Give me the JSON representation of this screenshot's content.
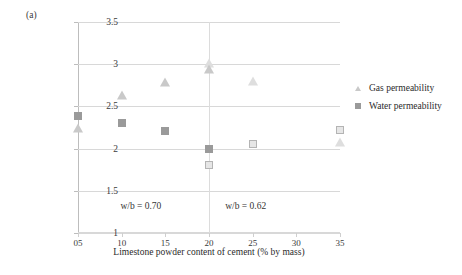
{
  "panel_label": "(a)",
  "chart_data": {
    "type": "scatter",
    "title": "",
    "xlabel": "Limestone powder content of cement (% by mass)",
    "ylabel_line1": "Gas permeability (×10⁻¹⁷ m²)",
    "ylabel_line2": "Water permeability (×10⁻¹⁷ m/s)",
    "xtick_labels": [
      "05",
      "10",
      "15",
      "20",
      "25",
      "30",
      "35"
    ],
    "xtick_values": [
      5,
      10,
      15,
      20,
      25,
      30,
      35
    ],
    "ytick_labels": [
      "1",
      "1.5",
      "2",
      "2.5",
      "3",
      "3.5"
    ],
    "ytick_values": [
      1,
      1.5,
      2,
      2.5,
      3,
      3.5
    ],
    "xlim": [
      5,
      35
    ],
    "ylim": [
      1,
      3.5
    ],
    "grid": "horizontal",
    "legend_position": "right",
    "series": [
      {
        "name": "Gas permeability",
        "marker": "triangle",
        "color": "#c9c9c9",
        "points": [
          {
            "x": 5,
            "y": 2.24,
            "fill": "filled"
          },
          {
            "x": 10,
            "y": 2.63,
            "fill": "filled"
          },
          {
            "x": 15,
            "y": 2.79,
            "fill": "filled"
          },
          {
            "x": 20,
            "y": 3.01,
            "fill": "open"
          },
          {
            "x": 20,
            "y": 2.94,
            "fill": "filled"
          },
          {
            "x": 25,
            "y": 2.8,
            "fill": "open"
          },
          {
            "x": 35,
            "y": 2.08,
            "fill": "open"
          }
        ]
      },
      {
        "name": "Water permeability",
        "marker": "square",
        "color": "#9a9a9a",
        "points": [
          {
            "x": 5,
            "y": 2.39,
            "fill": "filled"
          },
          {
            "x": 10,
            "y": 2.3,
            "fill": "filled"
          },
          {
            "x": 15,
            "y": 2.21,
            "fill": "filled"
          },
          {
            "x": 20,
            "y": 2.0,
            "fill": "filled"
          },
          {
            "x": 20,
            "y": 1.81,
            "fill": "open"
          },
          {
            "x": 25,
            "y": 2.06,
            "fill": "open"
          },
          {
            "x": 35,
            "y": 2.22,
            "fill": "open"
          }
        ]
      }
    ],
    "annotations": [
      {
        "text": "w/b = 0.70",
        "x": 12.2,
        "y": 1.38
      },
      {
        "text": "w/b = 0.62",
        "x": 24.2,
        "y": 1.38
      }
    ],
    "divider_x": 20,
    "legend_entries": [
      {
        "label": "Gas permeability",
        "marker": "triangle"
      },
      {
        "label": "Water permeability",
        "marker": "square"
      }
    ]
  }
}
